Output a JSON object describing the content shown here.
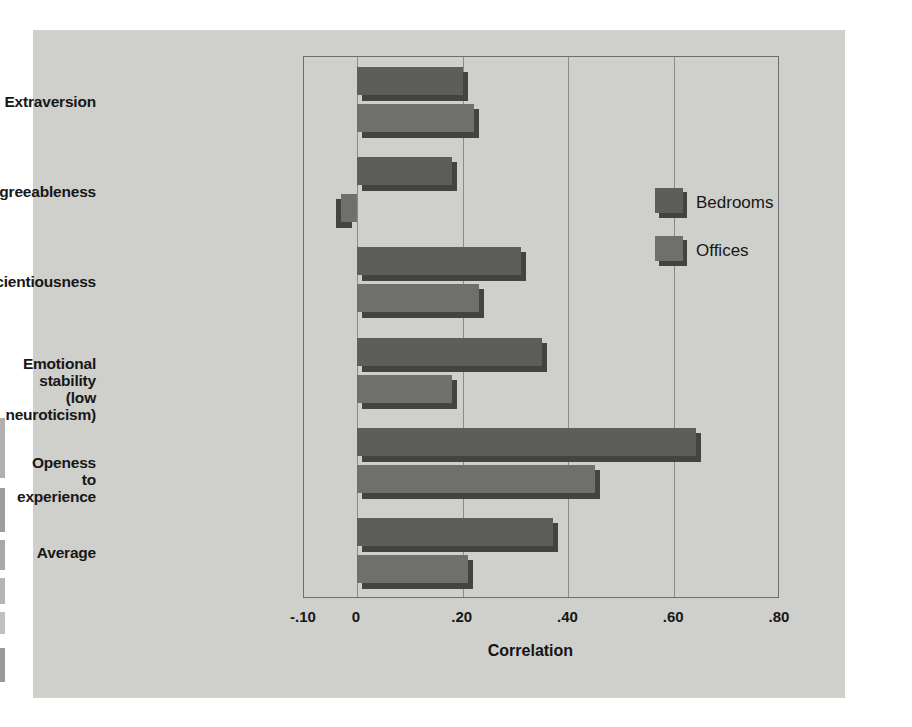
{
  "chart_data": {
    "type": "bar",
    "orientation": "horizontal",
    "title": "",
    "xlabel": "Correlation",
    "ylabel": "",
    "xlim": [
      -0.1,
      0.8
    ],
    "xticks": [
      -0.1,
      0,
      0.2,
      0.4,
      0.6,
      0.8
    ],
    "xticklabels": [
      "-.10",
      "0",
      ".20",
      ".40",
      ".60",
      ".80"
    ],
    "grid": true,
    "grid_axis": "x",
    "legend_position": "inside-upper-right",
    "categories": [
      "Extraversion",
      "Agreeableness",
      "Conscientiousness",
      "Emotional stability\n(low neuroticism)",
      "Openess to experience",
      "Average"
    ],
    "series": [
      {
        "name": "Bedrooms",
        "color": "#5d5d59",
        "values": [
          0.21,
          0.19,
          0.32,
          0.36,
          0.65,
          0.38
        ]
      },
      {
        "name": "Offices",
        "color": "#6f6f6b",
        "values": [
          0.23,
          -0.04,
          0.24,
          0.19,
          0.46,
          0.22
        ]
      }
    ]
  },
  "axis": {
    "x_title": "Correlation",
    "ticks": [
      {
        "label": "-.10",
        "value": -0.1
      },
      {
        "label": "0",
        "value": 0
      },
      {
        "label": ".20",
        "value": 0.2
      },
      {
        "label": ".40",
        "value": 0.4
      },
      {
        "label": ".60",
        "value": 0.6
      },
      {
        "label": ".80",
        "value": 0.8
      }
    ]
  },
  "legend": {
    "entries": [
      {
        "label": "Bedrooms",
        "swatch": "dark-grey-swatch"
      },
      {
        "label": "Offices",
        "swatch": "light-grey-swatch"
      }
    ]
  },
  "categories": [
    {
      "label": "Extraversion"
    },
    {
      "label": "Agreeableness"
    },
    {
      "label": "Conscientiousness"
    },
    {
      "label": "Emotional stability\n(low neuroticism)"
    },
    {
      "label": "Openess to experience"
    },
    {
      "label": "Average"
    }
  ],
  "colors": {
    "panel_background": "#cfcfcb",
    "bedrooms": "#5d5d59",
    "offices": "#6f6f6b",
    "bar_shadow": "#434340",
    "gridline": "#8a8a86",
    "plot_border": "#6e6e6e",
    "text": "#171717"
  }
}
